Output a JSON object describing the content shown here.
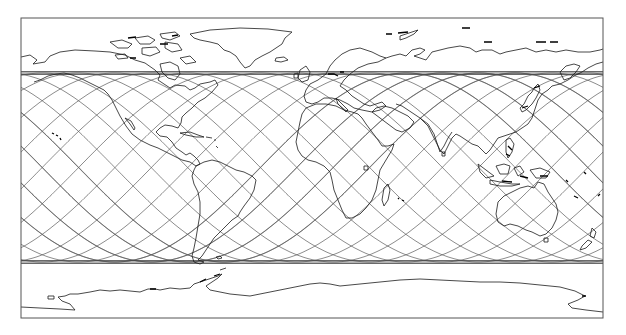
{
  "map": {
    "projection": "equirectangular",
    "frame": {
      "left": 21,
      "top": 18,
      "right": 603,
      "bottom": 318
    },
    "colors": {
      "background": "#ffffff",
      "frame": "#555555",
      "coastline": "#1a1a1a",
      "ground_track": "#5a5a5a"
    }
  },
  "ground_tracks": {
    "description": "Satellite ground tracks (sinusoidal) bounded by max latitude bands",
    "north_limit_y": 73,
    "south_limit_y": 262,
    "count": 16,
    "spacing_px": 36.4,
    "phase_x": 33,
    "bands": [
      {
        "name": "north-limit-band",
        "y": [
          71.5,
          73,
          74.5
        ]
      },
      {
        "name": "south-limit-band",
        "y": [
          260.5,
          262,
          263.5
        ]
      }
    ]
  },
  "landmasses": [
    "north-america",
    "greenland",
    "canadian-arctic-archipelago",
    "south-america",
    "europe",
    "africa",
    "madagascar",
    "asia",
    "japan",
    "indonesia",
    "australia",
    "new-zealand",
    "antarctica",
    "british-isles",
    "arabia",
    "india"
  ]
}
